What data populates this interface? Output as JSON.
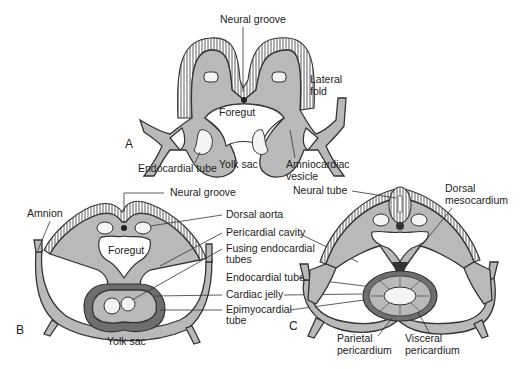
{
  "figure": {
    "panels": [
      {
        "id": "A",
        "label": "A",
        "structures": [
          "Neural groove",
          "Lateral fold",
          "Foregut",
          "Endocardial tube",
          "Yolk sac",
          "Amniocardiac vesicle"
        ]
      },
      {
        "id": "B",
        "label": "B",
        "structures": [
          "Neural groove",
          "Amnion",
          "Dorsal aorta",
          "Foregut",
          "Pericardial cavity",
          "Fusing endocardial tubes",
          "Endocardial tube",
          "Cardiac jelly",
          "Epimyocardial tube",
          "Yolk sac"
        ]
      },
      {
        "id": "C",
        "label": "C",
        "structures": [
          "Neural tube",
          "Dorsal mesocardium",
          "Parietal pericardium",
          "Visceral pericardium"
        ]
      }
    ]
  },
  "labels": {
    "a_neural_groove": "Neural groove",
    "a_lateral_fold_1": "Lateral",
    "a_lateral_fold_2": "fold",
    "a_foregut": "Foregut",
    "a_endocardial_tube": "Endocardial tube",
    "a_yolk_sac": "Yolk sac",
    "a_amniocardiac_1": "Amniocardiac",
    "a_amniocardiac_2": "vesicle",
    "b_neural_groove": "Neural groove",
    "b_amnion": "Amnion",
    "b_foregut": "Foregut",
    "b_yolk_sac": "Yolk sac",
    "mid_dorsal_aorta": "Dorsal aorta",
    "mid_pericardial_cavity": "Pericardial cavity",
    "mid_fusing_1": "Fusing endocardial",
    "mid_fusing_2": "tubes",
    "mid_endocardial_tube": "Endocardial tube",
    "mid_cardiac_jelly": "Cardiac jelly",
    "mid_epimyocardial_1": "Epimyocardial",
    "mid_epimyocardial_2": "tube",
    "c_neural_tube": "Neural tube",
    "c_dorsal_meso_1": "Dorsal",
    "c_dorsal_meso_2": "mesocardium",
    "c_parietal_1": "Parietal",
    "c_parietal_2": "pericardium",
    "c_visceral_1": "Visceral",
    "c_visceral_2": "pericardium",
    "panel_a": "A",
    "panel_b": "B",
    "panel_c": "C"
  },
  "colors": {
    "tissue": "#b9b9b9",
    "myocardium": "#6e6e6e",
    "cavity": "#ffffff",
    "line": "#333333"
  }
}
